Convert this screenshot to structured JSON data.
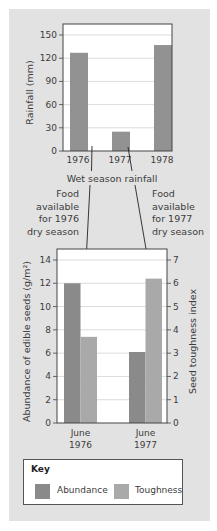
{
  "chart_data": [
    {
      "type": "bar",
      "title": "",
      "xlabel": "Wet season rainfall",
      "ylabel": "Rainfall (mm)",
      "categories": [
        "1976",
        "1977",
        "1978"
      ],
      "values": [
        127,
        25,
        137
      ],
      "ylim": [
        0,
        150
      ],
      "yticks": [
        0,
        30,
        60,
        90,
        120,
        150
      ],
      "grid": true,
      "bar_color": "#929292"
    },
    {
      "type": "bar",
      "title": "",
      "categories": [
        "June 1976",
        "June 1977"
      ],
      "category_lines": [
        [
          "June",
          "1976"
        ],
        [
          "June",
          "1977"
        ]
      ],
      "ylabel": "Abundance of edible seeds (g/m²)",
      "y2label": "Seed toughness index",
      "ylim": [
        0,
        14
      ],
      "y2lim": [
        0,
        7
      ],
      "yticks": [
        0,
        2,
        4,
        6,
        8,
        10,
        12,
        14
      ],
      "y2ticks": [
        0,
        1,
        2,
        3,
        4,
        5,
        6,
        7
      ],
      "grid": true,
      "series": [
        {
          "name": "Abundance",
          "axis": "left",
          "values": [
            12.0,
            6.1
          ],
          "color": "#8a8a8a"
        },
        {
          "name": "Toughness",
          "axis": "right",
          "values": [
            3.7,
            6.2
          ],
          "color": "#a9a9a9"
        }
      ],
      "legend_position": "bottom",
      "legend_title": "Key"
    }
  ],
  "annotations": {
    "rainfall_caption": "Wet season rainfall",
    "left_note": [
      "Food",
      "available",
      "for 1976",
      "dry season"
    ],
    "right_note": [
      "Food",
      "available",
      "for 1977",
      "dry season"
    ]
  },
  "key": {
    "title": "Key",
    "items": [
      {
        "label": "Abundance",
        "color": "#8a8a8a"
      },
      {
        "label": "Toughness",
        "color": "#a9a9a9"
      }
    ]
  }
}
